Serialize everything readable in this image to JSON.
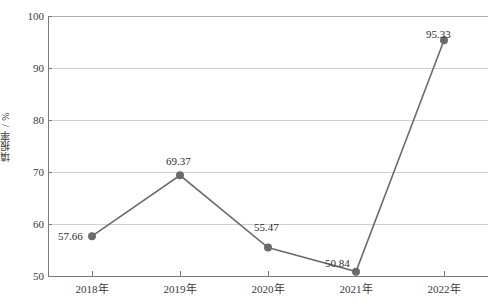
{
  "chart_data": {
    "type": "line",
    "title": "",
    "xlabel": "",
    "ylabel": "填报率 / %",
    "categories": [
      "2018年",
      "2019年",
      "2020年",
      "2021年",
      "2022年"
    ],
    "values": [
      57.66,
      69.37,
      55.47,
      50.84,
      95.33
    ],
    "point_labels": [
      "57.66",
      "69.37",
      "55.47",
      "50.84",
      "95.33"
    ],
    "ylim": [
      50,
      100
    ],
    "yticks": [
      50,
      60,
      70,
      80,
      90,
      100
    ],
    "ytick_labels": [
      "50",
      "60",
      "70",
      "80",
      "90",
      "100"
    ],
    "grid": true,
    "legend": "none",
    "series_name": "填报率",
    "colors": {
      "line": "#6b6b6b",
      "marker": "#6b6b6b",
      "grid": "#cfcfcf",
      "axis": "#7a7a7a",
      "text": "#3a3a3a",
      "background": "#ffffff"
    }
  }
}
